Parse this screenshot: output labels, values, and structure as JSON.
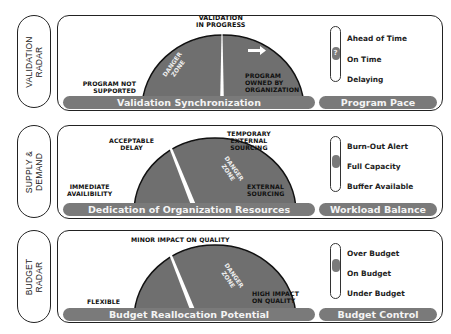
{
  "panels": [
    {
      "side_label": "VALIDATION\nRADAR",
      "bar_main": "Validation Synchronization",
      "bar_right": "Program Pace",
      "gauge_labels": {
        "left": "PROGRAM NOT\nSUPPORTED",
        "top": "VALIDATION\nIN PROGRESS",
        "right": "PROGRAM\nOWNED BY\nORGANIZATION"
      },
      "danger_zone": "DANGER\nZONE",
      "needle_state": "vertical (center)",
      "arrow": "right-arrow",
      "options": [
        "Ahead of Time",
        "On Time",
        "Delaying"
      ],
      "selected_option": "On Time",
      "knob_symbol": "?"
    },
    {
      "side_label": "SUPPLY &\nDEMAND",
      "bar_main": "Dedication of Organization Resources",
      "bar_right": "Workload Balance",
      "gauge_labels": {
        "left": "IMMEDIATE\nAVAILIBILITY",
        "top_left": "ACCEPTABLE\nDELAY",
        "top_right": "TEMPORARY\nEXTERNAL\nSOURCING",
        "right": "EXTERNAL\nSOURCING"
      },
      "danger_zone": "DANGER\nZONE",
      "options": [
        "Burn-Out Alert",
        "Full Capacity",
        "Buffer Available"
      ],
      "selected_option": "Full Capacity",
      "knob_symbol": ""
    },
    {
      "side_label": "BUDGET\nRADAR",
      "bar_main": "Budget Reallocation Potential",
      "bar_right": "Budget Control",
      "gauge_labels": {
        "left": "FLEXIBLE",
        "top": "MINOR IMPACT ON QUALITY",
        "right": "HIGH IMPACT\nON QUALITY"
      },
      "danger_zone": "DANGER\nZONE",
      "options": [
        "Over Budget",
        "On Budget",
        "Under Budget"
      ],
      "selected_option": "On Budget",
      "knob_symbol": ""
    }
  ],
  "colors": {
    "gauge_fill": "#6f6f6f",
    "bar_fill": "#7a7a7a",
    "border": "#222222",
    "bar_text": "#f4f4f4"
  }
}
